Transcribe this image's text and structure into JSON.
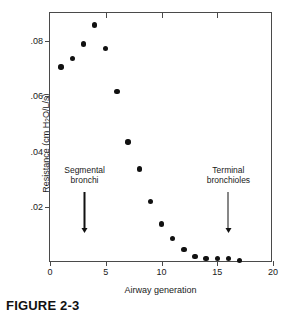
{
  "chart_data": {
    "type": "scatter",
    "title": "",
    "xlabel": "Airway generation",
    "ylabel": "Resistance (cm H2O/L/s)",
    "ylabel_parts": {
      "prefix": "Resistance (cm H",
      "sub": "2",
      "suffix": "O/L/s)"
    },
    "xlim": [
      0,
      20
    ],
    "ylim": [
      0,
      0.09
    ],
    "xticks": [
      0,
      5,
      10,
      15,
      20
    ],
    "xticklabels": [
      "0",
      "5",
      "10",
      "15",
      "20"
    ],
    "yticks": [
      0.02,
      0.04,
      0.06,
      0.08
    ],
    "yticklabels": [
      ".02",
      ".04",
      ".06",
      ".08"
    ],
    "grid": false,
    "legend": null,
    "marker": "filled-circle",
    "marker_color": "#111111",
    "frame_color": "#4a4a4a",
    "x": [
      1,
      2,
      3,
      4,
      5,
      6,
      7,
      8,
      9,
      10,
      11,
      12,
      13,
      14,
      15,
      16,
      17
    ],
    "values": [
      0.0705,
      0.0737,
      0.0789,
      0.0857,
      0.0773,
      0.0618,
      0.0435,
      0.0339,
      0.0222,
      0.014,
      0.0089,
      0.0049,
      0.0024,
      0.0017,
      0.0017,
      0.0016,
      0.001
    ],
    "annotations": [
      {
        "label_line1": "Segmental",
        "label_line2": "bronchi",
        "x": 3.1,
        "arrow_from_y": 0.0255,
        "arrow_to_y": 0.0108
      },
      {
        "label_line1": "Terminal",
        "label_line2": "bronchioles",
        "x": 16.0,
        "arrow_from_y": 0.0255,
        "arrow_to_y": 0.0108
      }
    ]
  },
  "caption": {
    "text": "FIGURE 2-3"
  }
}
